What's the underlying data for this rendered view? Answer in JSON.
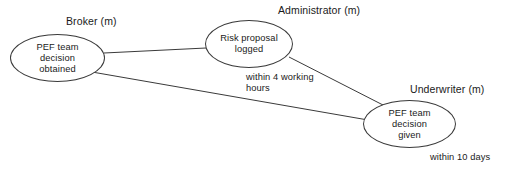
{
  "diagram": {
    "type": "activity-flow-graph",
    "lanes": [
      {
        "id": "broker",
        "label": "Broker (m)"
      },
      {
        "id": "administrator",
        "label": "Administrator (m)"
      },
      {
        "id": "underwriter",
        "label": "Underwriter (m)"
      }
    ],
    "nodes": [
      {
        "id": "pef-decision-obtained",
        "label": "PEF team\ndecision\nobtained",
        "lane": "broker"
      },
      {
        "id": "risk-proposal-logged",
        "label": "Risk proposal\nlogged",
        "lane": "administrator"
      },
      {
        "id": "pef-decision-given",
        "label": "PEF team\ndecision\ngiven",
        "lane": "underwriter"
      }
    ],
    "edges": [
      {
        "id": "obtained-to-logged",
        "from": "pef-decision-obtained",
        "to": "risk-proposal-logged",
        "label": ""
      },
      {
        "id": "obtained-to-given",
        "from": "pef-decision-obtained",
        "to": "pef-decision-given",
        "label": ""
      },
      {
        "id": "logged-to-given",
        "from": "risk-proposal-logged",
        "to": "pef-decision-given",
        "label": ""
      }
    ],
    "edge_labels": [
      {
        "id": "within-4-working-hours",
        "text": "within 4 working\nhours"
      },
      {
        "id": "within-10-days",
        "text": "within 10 days"
      }
    ],
    "colors": {
      "background": "#ffffff",
      "stroke": "#3a3a3a",
      "text": "#1a1a1a"
    }
  }
}
